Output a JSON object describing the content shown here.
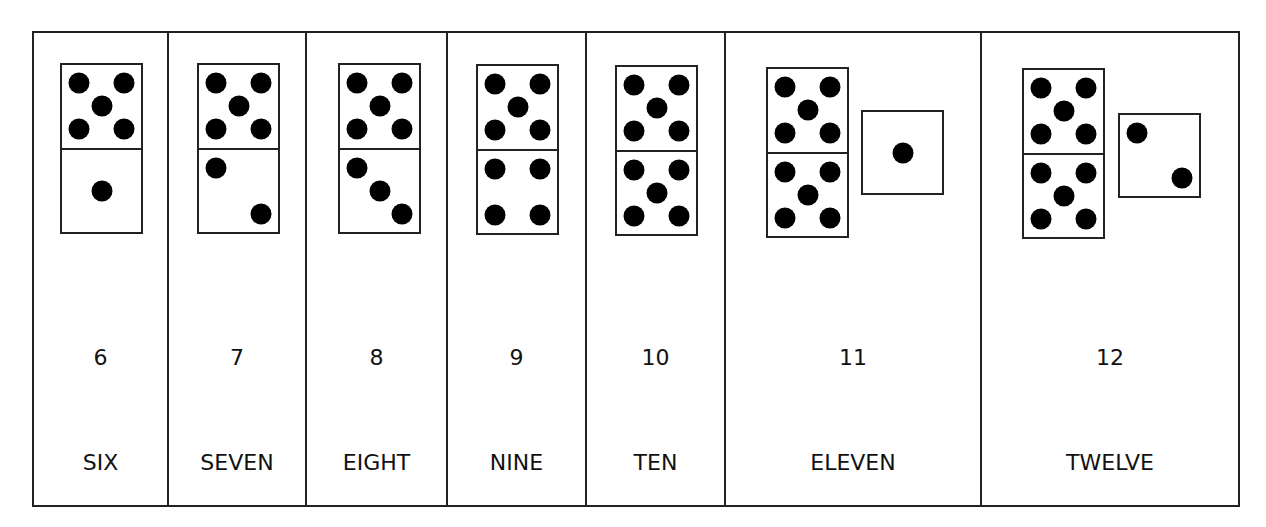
{
  "worksheet": {
    "panels": [
      {
        "number": "6",
        "word": "SIX",
        "width": 135,
        "domino": {
          "left": 26,
          "top": 30,
          "top_pips": 5,
          "bottom_pips": 1
        },
        "die": null
      },
      {
        "number": "7",
        "word": "SEVEN",
        "width": 138,
        "domino": {
          "left": 28,
          "top": 30,
          "top_pips": 5,
          "bottom_pips": 2
        },
        "die": null
      },
      {
        "number": "8",
        "word": "EIGHT",
        "width": 141,
        "domino": {
          "left": 31,
          "top": 30,
          "top_pips": 5,
          "bottom_pips": 3
        },
        "die": null
      },
      {
        "number": "9",
        "word": "NINE",
        "width": 139,
        "domino": {
          "left": 28,
          "top": 31,
          "top_pips": 5,
          "bottom_pips": 4
        },
        "die": null
      },
      {
        "number": "10",
        "word": "TEN",
        "width": 139,
        "domino": {
          "left": 28,
          "top": 32,
          "top_pips": 5,
          "bottom_pips": 5
        },
        "die": null
      },
      {
        "number": "11",
        "word": "ELEVEN",
        "width": 256,
        "domino": {
          "left": 40,
          "top": 34,
          "top_pips": 5,
          "bottom_pips": 5
        },
        "die": {
          "left": 135,
          "top": 77,
          "pips": 1
        }
      },
      {
        "number": "12",
        "word": "TWELVE",
        "width": 256,
        "domino": {
          "left": 40,
          "top": 35,
          "top_pips": 5,
          "bottom_pips": 5
        },
        "die": {
          "left": 136,
          "top": 80,
          "pips": 2
        }
      }
    ]
  },
  "colors": {
    "line": "#222222",
    "pip": "#000000",
    "background": "#ffffff"
  }
}
